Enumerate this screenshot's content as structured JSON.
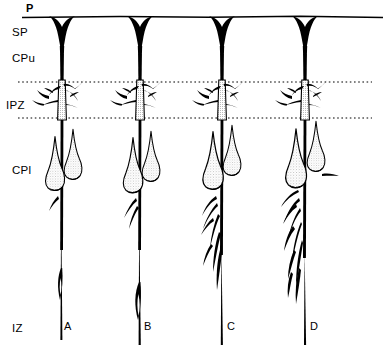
{
  "figure": {
    "kind": "camera-lucida-drawing",
    "background_color": "#ffffff",
    "ink_color": "#000000",
    "width": 392,
    "height": 355
  },
  "zone_labels": [
    {
      "id": "p",
      "text": "P",
      "x": 26,
      "y": 2,
      "bold": true
    },
    {
      "id": "sp",
      "text": "SP",
      "x": 12,
      "y": 26,
      "bold": false
    },
    {
      "id": "cpu",
      "text": "CPu",
      "x": 12,
      "y": 52,
      "bold": false
    },
    {
      "id": "ipz",
      "text": "IPZ",
      "x": 6,
      "y": 99,
      "bold": false
    },
    {
      "id": "cpl",
      "text": "CPl",
      "x": 12,
      "y": 164,
      "bold": false
    },
    {
      "id": "iz",
      "text": "IZ",
      "x": 12,
      "y": 322,
      "bold": false
    }
  ],
  "column_labels": [
    {
      "id": "a",
      "text": "A",
      "x": 64,
      "y": 320
    },
    {
      "id": "b",
      "text": "B",
      "x": 144,
      "y": 320
    },
    {
      "id": "c",
      "text": "C",
      "x": 227,
      "y": 320
    },
    {
      "id": "d",
      "text": "D",
      "x": 310,
      "y": 320
    }
  ],
  "boundaries": {
    "pial_surface": {
      "y": 17,
      "x_start": 22,
      "x_end": 383,
      "style": "solid"
    },
    "ipz_upper": {
      "y": 82,
      "x_start": 18,
      "x_end": 372,
      "style": "dotted"
    },
    "ipz_lower": {
      "y": 118,
      "x_start": 18,
      "x_end": 372,
      "style": "dotted"
    }
  },
  "neurons": [
    {
      "id": "neuron-a",
      "column": "A",
      "trunk_x": 62,
      "soma_y": 190,
      "axon_end_y": 340
    },
    {
      "id": "neuron-b",
      "column": "B",
      "trunk_x": 140,
      "soma_y": 190,
      "axon_end_y": 345
    },
    {
      "id": "neuron-c",
      "column": "C",
      "trunk_x": 222,
      "soma_y": 185,
      "axon_end_y": 345
    },
    {
      "id": "neuron-d",
      "column": "D",
      "trunk_x": 305,
      "soma_y": 183,
      "axon_end_y": 345
    }
  ]
}
